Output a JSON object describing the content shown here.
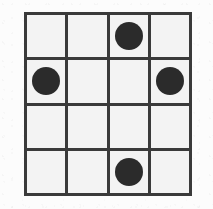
{
  "diagram": {
    "type": "grid-token-board",
    "rows": 4,
    "columns": 4,
    "colors": {
      "page_background": "#fcfcfc",
      "cell_background": "#f3f3f3",
      "grid_line": "#3a3a3a",
      "token_fill": "#2b2b2b"
    },
    "geometry": {
      "grid_left": 24,
      "grid_top": 12,
      "grid_width": 168,
      "grid_height": 184,
      "line_thickness": 3,
      "token_diameter": 28
    },
    "tokens": [
      {
        "row": 1,
        "column": 3
      },
      {
        "row": 2,
        "column": 1
      },
      {
        "row": 2,
        "column": 4
      },
      {
        "row": 4,
        "column": 3
      }
    ],
    "token_count": 4,
    "cells": [
      [
        {
          "filled": false
        },
        {
          "filled": false
        },
        {
          "filled": true
        },
        {
          "filled": false
        }
      ],
      [
        {
          "filled": true
        },
        {
          "filled": false
        },
        {
          "filled": false
        },
        {
          "filled": true
        }
      ],
      [
        {
          "filled": false
        },
        {
          "filled": false
        },
        {
          "filled": false
        },
        {
          "filled": false
        }
      ],
      [
        {
          "filled": false
        },
        {
          "filled": false
        },
        {
          "filled": true
        },
        {
          "filled": false
        }
      ]
    ]
  }
}
